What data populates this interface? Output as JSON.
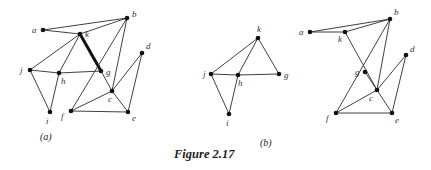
{
  "figure": {
    "title": "Figure 2.17",
    "graphs": [
      {
        "id": "a",
        "caption": "(a)",
        "nodes": [
          "a",
          "b",
          "k",
          "d",
          "j",
          "h",
          "g",
          "c",
          "f",
          "e",
          "i"
        ],
        "edges": [
          [
            "a",
            "b"
          ],
          [
            "a",
            "k"
          ],
          [
            "k",
            "b"
          ],
          [
            "k",
            "j"
          ],
          [
            "k",
            "h"
          ],
          [
            "k",
            "g"
          ],
          [
            "j",
            "h"
          ],
          [
            "j",
            "i"
          ],
          [
            "h",
            "i"
          ],
          [
            "h",
            "g"
          ],
          [
            "b",
            "f"
          ],
          [
            "b",
            "c"
          ],
          [
            "g",
            "c"
          ],
          [
            "c",
            "d"
          ],
          [
            "c",
            "f"
          ],
          [
            "c",
            "e"
          ],
          [
            "f",
            "e"
          ],
          [
            "d",
            "e"
          ]
        ],
        "highlighted_edges": [
          [
            "k",
            "g"
          ]
        ]
      },
      {
        "id": "b-left",
        "caption": "(b)",
        "nodes": [
          "k",
          "j",
          "h",
          "g",
          "i"
        ],
        "edges": [
          [
            "k",
            "j"
          ],
          [
            "k",
            "h"
          ],
          [
            "k",
            "g"
          ],
          [
            "j",
            "h"
          ],
          [
            "h",
            "g"
          ],
          [
            "j",
            "i"
          ],
          [
            "h",
            "i"
          ]
        ],
        "highlighted_edges": []
      },
      {
        "id": "b-right",
        "caption": "",
        "nodes": [
          "a",
          "b",
          "k",
          "d",
          "g",
          "c",
          "f",
          "e"
        ],
        "edges": [
          [
            "a",
            "b"
          ],
          [
            "a",
            "k"
          ],
          [
            "k",
            "b"
          ],
          [
            "k",
            "c"
          ],
          [
            "b",
            "f"
          ],
          [
            "b",
            "c"
          ],
          [
            "c",
            "d"
          ],
          [
            "c",
            "f"
          ],
          [
            "c",
            "e"
          ],
          [
            "f",
            "e"
          ],
          [
            "d",
            "e"
          ],
          [
            "g",
            "c"
          ]
        ],
        "highlighted_edges": []
      }
    ]
  }
}
